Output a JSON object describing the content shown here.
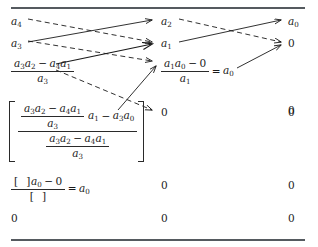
{
  "figure": {
    "name": "routh-array-cross-multiplication-diagram",
    "rules": {
      "top": "horizontal-rule",
      "bottom": "horizontal-rule"
    },
    "arrow_styles": {
      "solid": "solid",
      "dashed": "dashed"
    },
    "ink_color": "#1a1a1a",
    "rule_color": "#555a5f"
  },
  "rows": [
    {
      "id": "row-1",
      "col1": {
        "text": "a4",
        "base": "a",
        "sub": "4"
      },
      "col2": {
        "text": "a2",
        "base": "a",
        "sub": "2"
      },
      "col3": {
        "text": "a0",
        "base": "a",
        "sub": "0"
      }
    },
    {
      "id": "row-2",
      "col1": {
        "text": "a3",
        "base": "a",
        "sub": "3"
      },
      "col2": {
        "text": "a1",
        "base": "a",
        "sub": "1"
      },
      "col3": {
        "text": "0"
      }
    },
    {
      "id": "row-3",
      "col1": {
        "type": "fraction",
        "numerator": "a3a2 − a4a1",
        "denominator": "a3"
      },
      "col2": {
        "type": "fraction-equals",
        "numerator": "a1a0 − 0",
        "denominator": "a1",
        "equals": "=",
        "result": "a0"
      },
      "col3": {
        "text": "0"
      }
    },
    {
      "id": "row-4",
      "col1": {
        "type": "bracketed-nested-fraction",
        "numerator_left_fraction_num": "a3a2 − a4a1",
        "numerator_left_fraction_den": "a3",
        "numerator_tail": "a1 − a3a0",
        "denominator_fraction_num": "a3a2 − a4a1",
        "denominator_fraction_den": "a3"
      },
      "col2": {
        "text": "0"
      },
      "col3": {
        "text": "0"
      }
    },
    {
      "id": "row-5",
      "col1": {
        "type": "fraction-equals",
        "numerator": "[  ]a0 − 0",
        "denominator": "[  ]",
        "equals": "=",
        "result": "a0"
      },
      "col2": {
        "text": "0"
      },
      "col3": {
        "text": "0"
      }
    },
    {
      "id": "row-6",
      "col1": {
        "text": "0"
      },
      "col2": {
        "text": "0"
      },
      "col3": {
        "text": "0"
      }
    }
  ],
  "symbols": {
    "a": "a",
    "sub0": "0",
    "sub1": "1",
    "sub2": "2",
    "sub3": "3",
    "sub4": "4",
    "zero": "0",
    "minus": "−",
    "equals": "=",
    "open_bracket": "[",
    "close_bracket": "]",
    "empty_bracket": "[  ]"
  }
}
